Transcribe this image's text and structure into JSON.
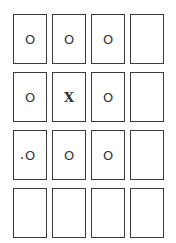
{
  "board": {
    "rows": 4,
    "cols": 4,
    "cells": [
      [
        "O",
        "O",
        "O",
        ""
      ],
      [
        "O",
        "X",
        "O",
        ""
      ],
      [
        "O",
        "O",
        "O",
        ""
      ],
      [
        "",
        "",
        "",
        ""
      ]
    ]
  }
}
